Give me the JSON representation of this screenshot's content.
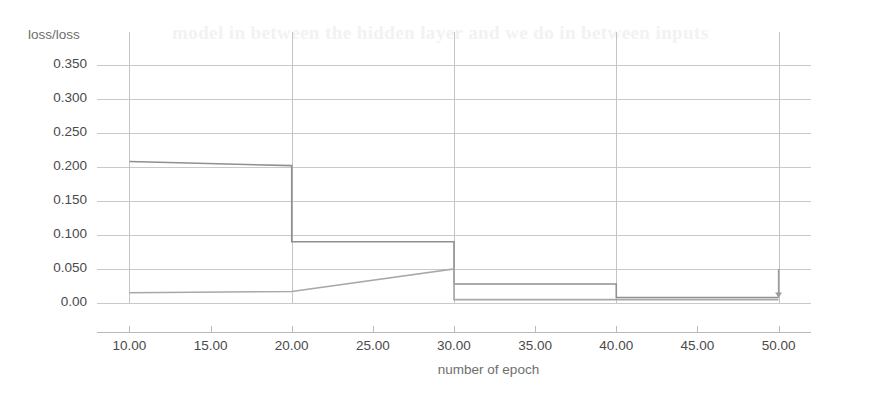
{
  "chart_data": {
    "type": "line",
    "title": "",
    "xlabel": "number of epoch",
    "ylabel": "loss/loss",
    "xlim": [
      8,
      52
    ],
    "ylim": [
      0.0,
      0.375
    ],
    "grid": true,
    "legend": "none",
    "x_ticks": [
      "10.00",
      "15.00",
      "20.00",
      "25.00",
      "30.00",
      "35.00",
      "40.00",
      "45.00",
      "50.00"
    ],
    "x_tick_values": [
      10,
      15,
      20,
      25,
      30,
      35,
      40,
      45,
      50
    ],
    "y_ticks": [
      "0.350",
      "0.300",
      "0.250",
      "0.200",
      "0.150",
      "0.100",
      "0.050",
      "0.00"
    ],
    "y_tick_values": [
      0.35,
      0.3,
      0.25,
      0.2,
      0.15,
      0.1,
      0.05,
      0.0
    ],
    "series": [
      {
        "name": "loss",
        "color": "#909090",
        "style": "step-decreasing",
        "x": [
          10,
          20,
          20,
          30,
          30,
          40,
          40,
          50
        ],
        "values": [
          0.208,
          0.202,
          0.09,
          0.09,
          0.028,
          0.028,
          0.008,
          0.008
        ]
      },
      {
        "name": "loss-second",
        "color": "#a8a8a8",
        "style": "rising-then-drop",
        "x": [
          10,
          20,
          30,
          30,
          50
        ],
        "values": [
          0.015,
          0.017,
          0.05,
          0.005,
          0.005
        ]
      }
    ],
    "annotations": [
      {
        "type": "drop-marker",
        "x": 50,
        "y_from": 0.05,
        "y_to": 0.008
      }
    ]
  },
  "axis": {
    "y_title": "loss/loss",
    "x_title": "number of epoch"
  },
  "background_text": {
    "line1": "model in between the hidden layer and we do in between inputs",
    "line2": "",
    "line3": "",
    "line4": "",
    "line5": "",
    "line6": ""
  }
}
